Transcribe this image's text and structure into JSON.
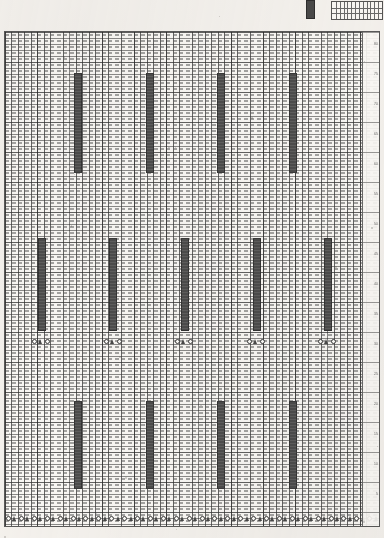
{
  "document": {
    "kind": "punch-card-pattern-chart",
    "title": "Knitting Pattern Punch Card Chart",
    "background_color": "#f6f4f1",
    "ink_color": "#4d4d4d",
    "grid_line_color": "#5a5a5a"
  },
  "legend": {
    "swatch_label": "filled-stitch",
    "swatch_color": "#4a4a4a",
    "swatch": {
      "x": 306,
      "y": 0,
      "w": 7,
      "h": 17
    },
    "key_box": {
      "x": 331,
      "y": 1,
      "w": 50,
      "h": 17
    },
    "key_box_columns": 13,
    "key_box_rows": 3
  },
  "chart": {
    "frame": {
      "x": 4,
      "y": 31,
      "w": 374,
      "h": 494
    },
    "cell_width": 6.45,
    "cell_height": 6.0,
    "columns": 58,
    "rows": 82,
    "major_every_columns": 5,
    "major_every_rows": 5,
    "gutter_width": 16
  },
  "chart_data": {
    "type": "heatmap",
    "xlabel": "",
    "ylabel": "",
    "grid": true,
    "legend_position": "top-right",
    "bands": [
      {
        "name": "upper-band",
        "y": 72,
        "height": 100,
        "bar_width": 8,
        "bars_x": [
          73,
          145,
          216,
          288
        ]
      },
      {
        "name": "middle-band",
        "y": 237,
        "height": 93,
        "bar_width": 8,
        "bars_x": [
          37,
          108,
          180,
          252,
          323
        ]
      },
      {
        "name": "lower-band",
        "y": 400,
        "height": 88,
        "bar_width": 8,
        "bars_x": [
          73,
          145,
          216,
          288
        ]
      }
    ],
    "symbol_rows": [
      {
        "name": "mid-symbol-row",
        "y": 338,
        "pattern": "grouped",
        "group_symbols": [
          "circle",
          "triangle",
          "circle"
        ],
        "group_start_x": [
          31,
          103,
          174,
          246,
          317
        ],
        "symbol_pitch": 6.45
      },
      {
        "name": "bottom-symbol-row",
        "y": 515,
        "pattern": "continuous",
        "repeat_symbols": [
          "circle",
          "triangle"
        ],
        "start_x": 5,
        "symbol_pitch": 6.45,
        "count": 58
      }
    ],
    "row_numbers": {
      "labels": [
        "80",
        "75",
        "70",
        "65",
        "60",
        "55",
        "50",
        "45",
        "40",
        "35",
        "30",
        "25",
        "20",
        "15",
        "10",
        "5"
      ],
      "y_positions": [
        40,
        70,
        100,
        130,
        160,
        190,
        220,
        250,
        280,
        310,
        340,
        370,
        400,
        430,
        460,
        490
      ]
    }
  }
}
